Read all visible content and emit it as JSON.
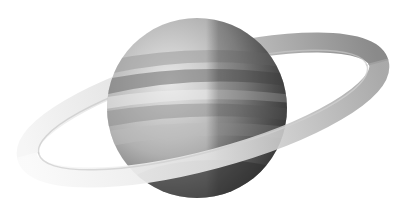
{
  "image": {
    "subject": "Ringed planet (Saturn-like) illustration",
    "style": "grayscale",
    "background": "#ffffff"
  },
  "planet": {
    "center": [
      197,
      108
    ],
    "radius": 90,
    "colors": {
      "light": "#e6e6e6",
      "mid": "#a8a8a8",
      "dark": "#4a4a4a",
      "band": "#7a7a7a"
    }
  },
  "ring": {
    "center": [
      203,
      110
    ],
    "rx": 182,
    "ry": 50,
    "rotation_deg": -15,
    "colors": {
      "far": "#8c8c8c",
      "near_fade": "#f4f4f4"
    }
  }
}
